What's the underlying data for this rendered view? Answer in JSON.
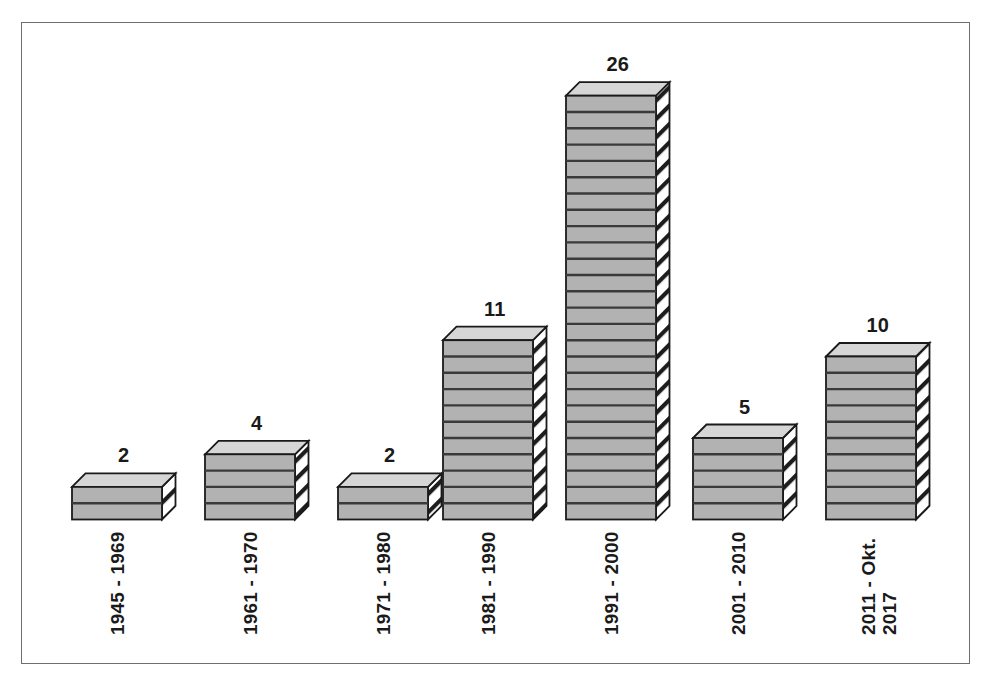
{
  "figure": {
    "frame_color": "#6e6e6e",
    "background": "#ffffff"
  },
  "chart_data": {
    "type": "bar",
    "title": "",
    "subtitle": "",
    "xlabel": "",
    "ylabel": "",
    "grid": false,
    "legend": "none",
    "style": "3d-stacked-block",
    "ylim": [
      0,
      26
    ],
    "categories": [
      "1945 - 1969",
      "1961 - 1970",
      "1971 - 1980",
      "1981 - 1990",
      "1991 - 2000",
      "2001 - 2010",
      "2011 - Okt.\n2017"
    ],
    "values": [
      2,
      4,
      2,
      11,
      26,
      5,
      10
    ],
    "data_labels": [
      "2",
      "4",
      "2",
      "11",
      "26",
      "5",
      "10"
    ],
    "colors": {
      "bar_front": "#b2b2b2",
      "bar_top": "#d6d6d6",
      "bar_side": "#ffffff",
      "bar_outline": "#1a1a1a",
      "segment_divider": "#3a3a3a",
      "hatch": "#1a1a1a",
      "label_text": "#1a1a1a"
    }
  },
  "bars": [
    {
      "label": "1945 - 1969",
      "value": 2,
      "value_text": "2",
      "tick_lines": [
        "1945 - 1969"
      ]
    },
    {
      "label": "1961 - 1970",
      "value": 4,
      "value_text": "4",
      "tick_lines": [
        "1961 - 1970"
      ]
    },
    {
      "label": "1971 - 1980",
      "value": 2,
      "value_text": "2",
      "tick_lines": [
        "1971 - 1980"
      ]
    },
    {
      "label": "1981 - 1990",
      "value": 11,
      "value_text": "11",
      "tick_lines": [
        "1981 - 1990"
      ]
    },
    {
      "label": "1991 - 2000",
      "value": 26,
      "value_text": "26",
      "tick_lines": [
        "1991 - 2000"
      ]
    },
    {
      "label": "2001 - 2010",
      "value": 5,
      "value_text": "5",
      "tick_lines": [
        "2001 - 2010"
      ]
    },
    {
      "label": "2011 - Okt. 2017",
      "value": 10,
      "value_text": "10",
      "tick_lines": [
        "2011 - Okt.",
        "2017"
      ]
    }
  ]
}
